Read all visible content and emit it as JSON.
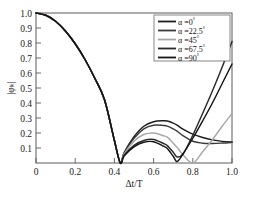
{
  "figure": {
    "background": "#ffffff",
    "frame_color": "#5a5a5a",
    "caption_fragment": ""
  },
  "axes": {
    "xlabel": "Δt/T",
    "ylabel": "|φₖ|",
    "x_ticks": [
      "0",
      "0.2",
      "0.4",
      "0.6",
      "0.8",
      "1.0"
    ],
    "y_ticks": [
      "1.0",
      "0.9",
      "0.8",
      "0.7",
      "0.6",
      "0.5",
      "0.4",
      "0.3",
      "0.2",
      "0.1"
    ]
  },
  "legend": {
    "position": "top-right",
    "items": [
      {
        "label_prefix": "α =",
        "value": "0",
        "unit": "°",
        "color": "#1c1c1c"
      },
      {
        "label_prefix": "α =",
        "value": "22.5",
        "unit": "°",
        "color": "#3a3a3a"
      },
      {
        "label_prefix": "α =",
        "value": "45",
        "unit": "°",
        "color": "#a8a8a8"
      },
      {
        "label_prefix": "α =",
        "value": "67.5",
        "unit": "°",
        "color": "#2a2a2a"
      },
      {
        "label_prefix": "α =",
        "value": "90",
        "unit": "°",
        "color": "#151515"
      }
    ]
  },
  "chart_data": {
    "type": "line",
    "title": "",
    "xlabel": "Δt/T",
    "ylabel": "|φₖ|",
    "xlim": [
      0,
      1.0
    ],
    "ylim": [
      0,
      1.0
    ],
    "grid": false,
    "legend_position": "top-right",
    "x": [
      0.0,
      0.05,
      0.1,
      0.15,
      0.2,
      0.25,
      0.3,
      0.35,
      0.4,
      0.43,
      0.45,
      0.5,
      0.55,
      0.6,
      0.65,
      0.67,
      0.7,
      0.72,
      0.75,
      0.8,
      0.85,
      0.9,
      0.95,
      1.0
    ],
    "series": [
      {
        "name": "α = 0°",
        "color": "#1c1c1c",
        "values": [
          1.0,
          0.985,
          0.945,
          0.88,
          0.795,
          0.69,
          0.565,
          0.42,
          0.15,
          0.0,
          0.07,
          0.175,
          0.245,
          0.275,
          0.282,
          0.28,
          0.266,
          0.252,
          0.226,
          0.192,
          0.17,
          0.154,
          0.144,
          0.14
        ]
      },
      {
        "name": "α = 22.5°",
        "color": "#3a3a3a",
        "values": [
          1.0,
          0.985,
          0.945,
          0.88,
          0.795,
          0.69,
          0.565,
          0.42,
          0.15,
          0.0,
          0.068,
          0.165,
          0.228,
          0.252,
          0.25,
          0.246,
          0.228,
          0.212,
          0.182,
          0.145,
          0.132,
          0.13,
          0.133,
          0.138
        ]
      },
      {
        "name": "α = 45°",
        "color": "#a8a8a8",
        "values": [
          1.0,
          0.985,
          0.945,
          0.88,
          0.795,
          0.69,
          0.565,
          0.42,
          0.15,
          0.0,
          0.06,
          0.145,
          0.19,
          0.2,
          0.182,
          0.172,
          0.132,
          0.104,
          0.055,
          0.0,
          0.075,
          0.155,
          0.245,
          0.33
        ]
      },
      {
        "name": "α = 67.5°",
        "color": "#2a2a2a",
        "values": [
          1.0,
          0.985,
          0.945,
          0.88,
          0.795,
          0.69,
          0.565,
          0.42,
          0.15,
          0.0,
          0.052,
          0.118,
          0.15,
          0.157,
          0.13,
          0.116,
          0.072,
          0.04,
          0.06,
          0.185,
          0.33,
          0.48,
          0.64,
          0.81
        ]
      },
      {
        "name": "α = 90°",
        "color": "#151515",
        "values": [
          1.0,
          0.985,
          0.945,
          0.88,
          0.795,
          0.69,
          0.565,
          0.42,
          0.15,
          0.0,
          0.048,
          0.108,
          0.138,
          0.142,
          0.112,
          0.096,
          0.045,
          0.01,
          0.06,
          0.165,
          0.28,
          0.4,
          0.53,
          0.66
        ]
      }
    ],
    "annotations": {
      "common_first_null_x": 0.43,
      "null_45deg_x": 0.8,
      "null_67p5deg_x": 0.725,
      "null_90deg_x": 0.715
    }
  }
}
